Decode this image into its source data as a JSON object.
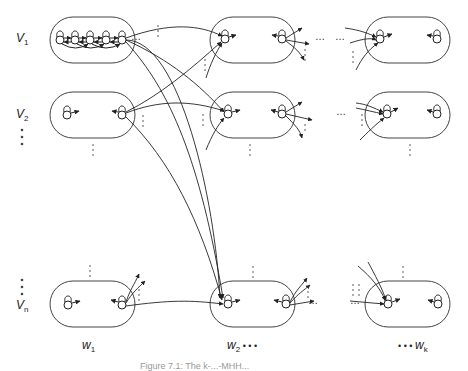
{
  "diagram": {
    "row_labels": [
      {
        "base": "V",
        "sub": "1"
      },
      {
        "base": "V",
        "sub": "2"
      },
      {
        "base": "V",
        "sub": "n"
      }
    ],
    "column_labels": [
      {
        "prefix": "",
        "base": "w",
        "sub": "1",
        "suffix": ""
      },
      {
        "prefix": "",
        "base": "w",
        "sub": "2",
        "suffix": " • • •"
      },
      {
        "prefix": "• • • ",
        "base": "w",
        "sub": "k",
        "suffix": ""
      }
    ],
    "ellipsis_h": "…",
    "caption": "Figure 7.1: The k-...-MHH..."
  }
}
